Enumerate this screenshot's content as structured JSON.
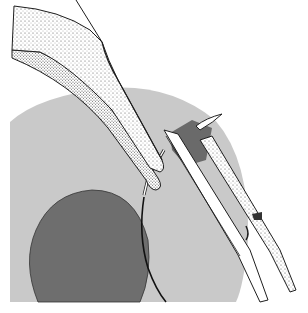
{
  "illustration": {
    "subject": "surgical forceps and needle holder passing a curved suture needle through tissue",
    "colors": {
      "background": "#ffffff",
      "tissue_light": "#c9c9c9",
      "tissue_dark": "#6e6e6e",
      "flap": "#6a6a6a",
      "instrument_fill": "#ffffff",
      "outline": "#1e1e1e",
      "stipple": "#555555"
    }
  }
}
